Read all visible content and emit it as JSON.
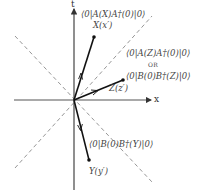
{
  "axes": {
    "vertical_label": "t",
    "horizontal_label": "x"
  },
  "points": {
    "X": {
      "label": "X(x′)",
      "x": 94,
      "y": 37
    },
    "Z": {
      "label": "Z(z′)",
      "x": 123,
      "y": 80
    },
    "Y": {
      "label": "Y(y′)",
      "x": 89,
      "y": 160
    }
  },
  "annotations": {
    "x_correlator": "⟨0|A(X)A†(0)|0⟩",
    "z_correlator_1": "⟨0|A(Z)A†(0)|0⟩",
    "or_label": "OR",
    "z_correlator_2": "⟨0|B(0)B†(Z)|0⟩",
    "y_correlator": "⟨0|B(0)B†(Y)|0⟩"
  },
  "colors": {
    "axis": "#333333",
    "vector": "#111111",
    "lightcone": "#888888",
    "text": "#444444"
  }
}
